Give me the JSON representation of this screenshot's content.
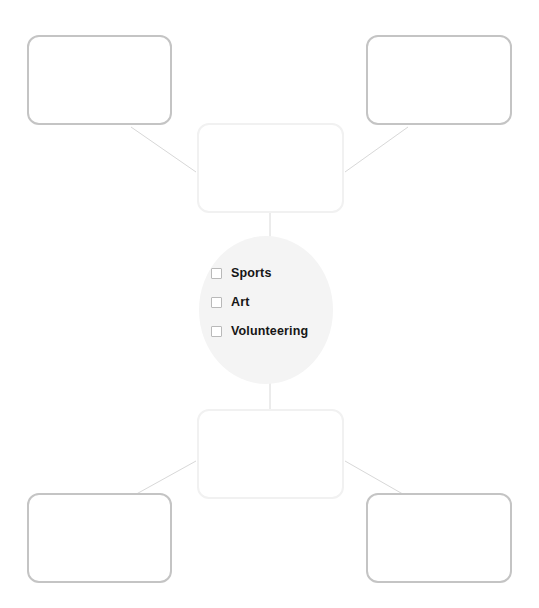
{
  "diagram": {
    "type": "mind-map",
    "background_color": "#ffffff",
    "canvas": {
      "width": 539,
      "height": 608
    }
  },
  "center": {
    "shape": "ellipse",
    "fill_color": "#f4f4f4",
    "checkbox_border_color": "#b9b9b9",
    "label_color": "#161616",
    "items": [
      {
        "label": "Sports",
        "checked": false
      },
      {
        "label": "Art",
        "checked": false
      },
      {
        "label": "Volunteering",
        "checked": false
      }
    ]
  },
  "nodes": [
    {
      "id": "top-left",
      "text": "",
      "border_color": "#c4c4c4"
    },
    {
      "id": "top-right",
      "text": "",
      "border_color": "#c4c4c4"
    },
    {
      "id": "top-center",
      "text": "",
      "border_color": "#f1f1f1"
    },
    {
      "id": "bottom-center",
      "text": "",
      "border_color": "#f1f1f1"
    },
    {
      "id": "bottom-left",
      "text": "",
      "border_color": "#c4c4c4"
    },
    {
      "id": "bottom-right",
      "text": "",
      "border_color": "#c4c4c4"
    }
  ],
  "connectors": {
    "line_color": "#d8d8d8",
    "line_width": 1,
    "edges": [
      {
        "from": "top-left",
        "to": "top-center",
        "style": "diagonal"
      },
      {
        "from": "top-right",
        "to": "top-center",
        "style": "diagonal"
      },
      {
        "from": "top-center",
        "to": "center",
        "style": "vertical"
      },
      {
        "from": "center",
        "to": "bottom-center",
        "style": "vertical"
      },
      {
        "from": "bottom-center",
        "to": "bottom-left",
        "style": "diagonal"
      },
      {
        "from": "bottom-center",
        "to": "bottom-right",
        "style": "diagonal"
      }
    ]
  }
}
